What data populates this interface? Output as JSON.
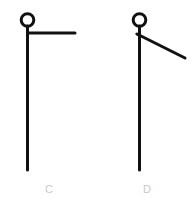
{
  "canvas": {
    "width": 196,
    "height": 206,
    "background_color": "#ffffff"
  },
  "style": {
    "stroke_color": "#111111",
    "stroke_width": 3,
    "label_color": "#c9c9c9"
  },
  "figures": [
    {
      "id": "figure-c",
      "label": "C",
      "description": "stick figure with circular head and horizontal arm",
      "head": {
        "cx": 27.5,
        "cy": 20,
        "r": 6.5
      },
      "body": {
        "x1": 27.5,
        "y1": 26.5,
        "x2": 27.5,
        "y2": 170
      },
      "arm": {
        "x1": 27.5,
        "y1": 33,
        "x2": 75,
        "y2": 33,
        "orientation": "horizontal"
      }
    },
    {
      "id": "figure-d",
      "label": "D",
      "description": "stick figure with circular head and downward sloping arm",
      "head": {
        "cx": 139.5,
        "cy": 20,
        "r": 6.5
      },
      "body": {
        "x1": 139.5,
        "y1": 26.5,
        "x2": 139.5,
        "y2": 170
      },
      "arm": {
        "x1": 137,
        "y1": 34,
        "x2": 185,
        "y2": 58,
        "orientation": "diagonal-down"
      }
    }
  ]
}
